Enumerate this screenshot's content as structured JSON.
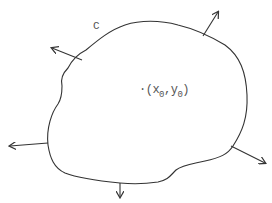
{
  "diagram": {
    "curve_label": "C",
    "point": {
      "dot": "·",
      "open_paren": "(",
      "x_var": "x",
      "x_sub": "0",
      "comma": ",",
      "y_var": "y",
      "y_sub": "0",
      "close_paren": ")"
    },
    "stroke_color": "#333333",
    "text_color": "#555555",
    "outward_normal_arrows": [
      {
        "name": "upper-left",
        "from": [
          82,
          60
        ],
        "to": [
          52,
          48
        ]
      },
      {
        "name": "top-right",
        "from": [
          203,
          36
        ],
        "to": [
          218,
          12
        ]
      },
      {
        "name": "lower-right",
        "from": [
          231,
          146
        ],
        "to": [
          265,
          163
        ]
      },
      {
        "name": "bottom",
        "from": [
          120,
          183
        ],
        "to": [
          120,
          197
        ]
      },
      {
        "name": "left",
        "from": [
          48,
          143
        ],
        "to": [
          10,
          146
        ]
      }
    ]
  }
}
